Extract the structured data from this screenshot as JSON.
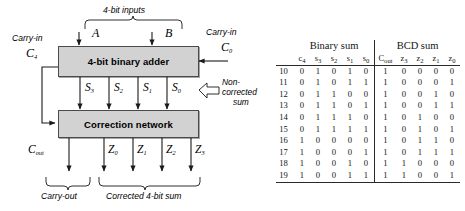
{
  "diagram": {
    "top_brace_label": "4-bit inputs",
    "input_a": "A",
    "input_b": "B",
    "carry_in_left_label": "Carry-in",
    "carry_in_left_sym": "C",
    "carry_in_left_sub": "4",
    "carry_in_right_label": "Carry-in",
    "carry_in_right_sym": "C",
    "carry_in_right_sub": "0",
    "adder_label": "4-bit binary adder",
    "correction_label": "Correction network",
    "noncorrected_line1": "Non-",
    "noncorrected_line2": "corrected",
    "noncorrected_line3": "sum",
    "sum_bits": [
      {
        "sym": "S",
        "sub": "3"
      },
      {
        "sym": "S",
        "sub": "2"
      },
      {
        "sym": "S",
        "sub": "1"
      },
      {
        "sym": "S",
        "sub": "0"
      }
    ],
    "z_bits": [
      {
        "sym": "Z",
        "sub": "0"
      },
      {
        "sym": "Z",
        "sub": "1"
      },
      {
        "sym": "Z",
        "sub": "2"
      },
      {
        "sym": "Z",
        "sub": "3"
      }
    ],
    "cout_sym": "C",
    "cout_sub": "out",
    "carry_out_brace_label": "Carry-out",
    "corrected_brace_label": "Corrected 4-bit sum"
  },
  "table": {
    "group_headers": [
      "Binary sum",
      "BCD sum"
    ],
    "columns": [
      {
        "sym": "c",
        "sub": "4"
      },
      {
        "sym": "s",
        "sub": "3"
      },
      {
        "sym": "s",
        "sub": "2"
      },
      {
        "sym": "s",
        "sub": "1"
      },
      {
        "sym": "s",
        "sub": "0"
      },
      {
        "sym": "C",
        "sub": "out"
      },
      {
        "sym": "z",
        "sub": "3"
      },
      {
        "sym": "z",
        "sub": "2"
      },
      {
        "sym": "z",
        "sub": "1"
      },
      {
        "sym": "z",
        "sub": "0"
      }
    ],
    "rows": [
      {
        "index": "10",
        "binary": [
          "0",
          "1",
          "0",
          "1",
          "0"
        ],
        "bcd": [
          "1",
          "0",
          "0",
          "0",
          "0"
        ]
      },
      {
        "index": "11",
        "binary": [
          "0",
          "1",
          "0",
          "1",
          "1"
        ],
        "bcd": [
          "1",
          "0",
          "0",
          "0",
          "1"
        ]
      },
      {
        "index": "12",
        "binary": [
          "0",
          "1",
          "1",
          "0",
          "0"
        ],
        "bcd": [
          "1",
          "0",
          "0",
          "1",
          "0"
        ]
      },
      {
        "index": "13",
        "binary": [
          "0",
          "1",
          "1",
          "0",
          "1"
        ],
        "bcd": [
          "1",
          "0",
          "0",
          "1",
          "1"
        ]
      },
      {
        "index": "14",
        "binary": [
          "0",
          "1",
          "1",
          "1",
          "0"
        ],
        "bcd": [
          "1",
          "0",
          "1",
          "0",
          "0"
        ]
      },
      {
        "index": "15",
        "binary": [
          "0",
          "1",
          "1",
          "1",
          "1"
        ],
        "bcd": [
          "1",
          "0",
          "1",
          "0",
          "1"
        ]
      },
      {
        "index": "16",
        "binary": [
          "1",
          "0",
          "0",
          "0",
          "0"
        ],
        "bcd": [
          "1",
          "0",
          "1",
          "1",
          "0"
        ]
      },
      {
        "index": "17",
        "binary": [
          "1",
          "0",
          "0",
          "0",
          "1"
        ],
        "bcd": [
          "1",
          "0",
          "1",
          "1",
          "1"
        ]
      },
      {
        "index": "18",
        "binary": [
          "1",
          "0",
          "0",
          "1",
          "0"
        ],
        "bcd": [
          "1",
          "1",
          "0",
          "0",
          "0"
        ]
      },
      {
        "index": "19",
        "binary": [
          "1",
          "0",
          "0",
          "1",
          "1"
        ],
        "bcd": [
          "1",
          "1",
          "0",
          "0",
          "1"
        ]
      }
    ]
  },
  "colors": {
    "box_fill": "#d2d2d2",
    "box_stroke": "#4a4a4a",
    "line": "#1a1a1a",
    "text": "#000000"
  }
}
